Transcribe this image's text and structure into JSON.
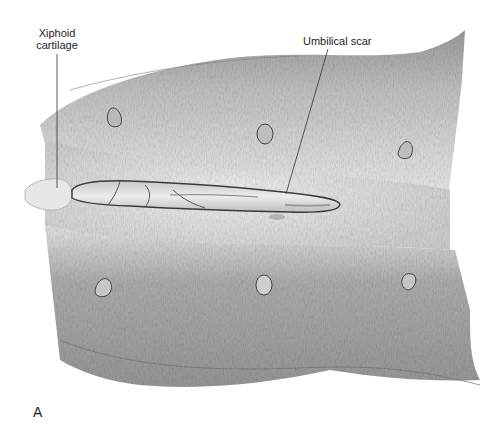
{
  "figure": {
    "panel_letter": "A",
    "labels": {
      "xiphoid_line1": "Xiphoid",
      "xiphoid_line2": "cartilage",
      "umbilical": "Umbilical scar"
    },
    "colors": {
      "background": "#ffffff",
      "fur_dark": "#8a8a8a",
      "fur_mid": "#b5b5b5",
      "fur_light": "#e4e4e4",
      "incision_fill": "#d9d9d9",
      "ink": "#333333"
    },
    "teats_upper": [
      "left",
      "center",
      "right"
    ],
    "teats_lower": [
      "left",
      "center",
      "right"
    ]
  }
}
